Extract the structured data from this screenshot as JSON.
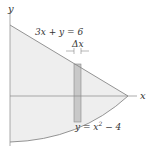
{
  "diagram": {
    "axes": {
      "x_label": "x",
      "y_label": "y"
    },
    "curves": [
      {
        "name": "line",
        "label_lhs": "3x + y = 6"
      },
      {
        "name": "parabola",
        "label_lhs": "y = x",
        "label_exp": "2",
        "label_rhs": " − 4"
      }
    ],
    "strip": {
      "width_label": "Δx"
    },
    "colors": {
      "region_fill": "#eeeeee",
      "strip_fill": "#c8c8c8",
      "curve_stroke": "#888888",
      "axis_stroke": "#888888",
      "text": "#333333"
    }
  }
}
